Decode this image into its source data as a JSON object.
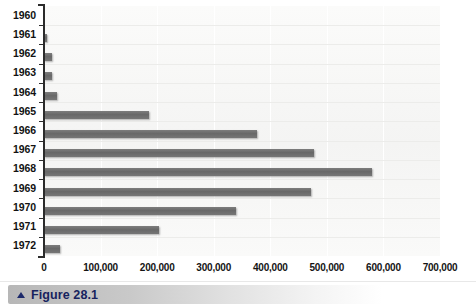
{
  "caption": {
    "marker": "triangle-up",
    "text": "Figure 28.1"
  },
  "chart_data": {
    "type": "bar",
    "orientation": "horizontal",
    "title": "",
    "subtitle": "",
    "xlabel": "",
    "ylabel": "",
    "categories": [
      "1960",
      "1961",
      "1962",
      "1963",
      "1964",
      "1965",
      "1966",
      "1967",
      "1968",
      "1969",
      "1970",
      "1971",
      "1972"
    ],
    "values": [
      0,
      5000,
      14000,
      14000,
      23000,
      185000,
      377000,
      478000,
      580000,
      472000,
      340000,
      203000,
      28000
    ],
    "xlim": [
      0,
      700000
    ],
    "xticks": [
      0,
      100000,
      200000,
      300000,
      400000,
      500000,
      600000,
      700000
    ],
    "xtick_labels": [
      "0",
      "100,000",
      "200,000",
      "300,000",
      "400,000",
      "500,000",
      "600,000",
      "700,000"
    ],
    "grid": "vertical-and-horizontal",
    "legend": "none",
    "bar_color": "#6f6f6f",
    "plot_background": "#f7f7f6",
    "axis_color": "#2b2b2b"
  }
}
